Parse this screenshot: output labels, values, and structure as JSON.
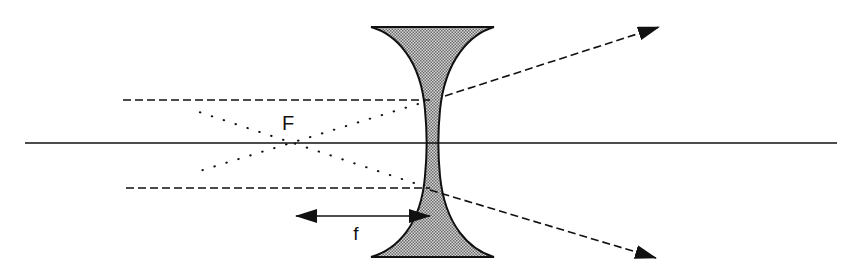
{
  "diagram": {
    "type": "optics-ray-diagram",
    "labels": {
      "focal_point": "F",
      "focal_length": "f"
    },
    "elements": [
      {
        "name": "optical-axis",
        "style": "solid"
      },
      {
        "name": "concave-lens",
        "fill": "stippled gray"
      },
      {
        "name": "incident-ray-upper",
        "style": "dashed"
      },
      {
        "name": "refracted-ray-upper",
        "style": "dashed",
        "arrow": true
      },
      {
        "name": "incident-ray-lower",
        "style": "dashed"
      },
      {
        "name": "refracted-ray-lower",
        "style": "dashed",
        "arrow": true
      },
      {
        "name": "virtual-extension-upper",
        "style": "dotted",
        "converges_at": "F"
      },
      {
        "name": "virtual-extension-lower",
        "style": "dotted",
        "converges_at": "F"
      },
      {
        "name": "focal-length-marker",
        "style": "double-arrow"
      }
    ],
    "colors": {
      "stroke": "#111111",
      "lens_fill": "#b8b8b8",
      "background": "#ffffff"
    }
  }
}
